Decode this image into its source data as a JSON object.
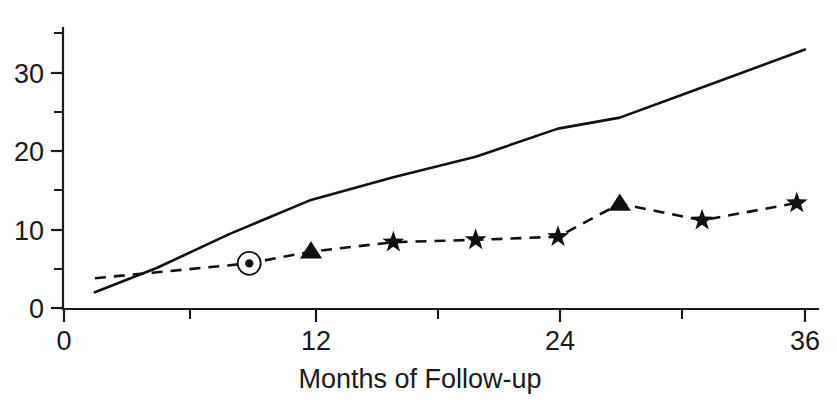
{
  "chart_data": {
    "type": "line",
    "title": "",
    "subtitle": "",
    "xlabel": "Months of Follow-up",
    "ylabel": "",
    "xlim": [
      0,
      36.8
    ],
    "ylim": [
      0,
      35
    ],
    "grid": false,
    "legend": "none",
    "x_ticks_major": [
      0,
      12,
      24,
      36
    ],
    "x_tick_labels": [
      "0",
      "12",
      "24",
      "36"
    ],
    "x_ticks_minor": [
      6,
      18,
      30
    ],
    "y_ticks_major": [
      0,
      10,
      20,
      30
    ],
    "y_tick_labels": [
      "0",
      "10",
      "20",
      "30"
    ],
    "y_ticks_minor": [
      5,
      15,
      25,
      35
    ],
    "series": [
      {
        "name": "solid-line",
        "style": "solid",
        "marker": "none",
        "color": "#111111",
        "x": [
          1.5,
          4.5,
          8,
          12,
          16,
          20,
          24,
          27,
          30,
          36
        ],
        "values": [
          2.0,
          5.1,
          9.4,
          13.8,
          16.7,
          19.3,
          22.9,
          24.3,
          27.2,
          33.0
        ]
      },
      {
        "name": "dashed-line",
        "style": "dashed",
        "marker": "mixed",
        "color": "#111111",
        "x": [
          1.5,
          9,
          12,
          16,
          20,
          24,
          27,
          31,
          35.6
        ],
        "values": [
          3.8,
          5.7,
          7.2,
          8.4,
          8.7,
          9.1,
          13.3,
          11.2,
          13.4
        ],
        "markers": [
          "none",
          "circled-dot",
          "triangle",
          "star",
          "star",
          "star",
          "triangle",
          "star",
          "star"
        ]
      }
    ],
    "annotations": [
      {
        "name": "circled-dot-marker",
        "x": 9,
        "y": 5.7,
        "shape": "circled-dot"
      }
    ]
  },
  "axis": {
    "x_title": "Months of Follow-up",
    "y_title": ""
  },
  "colors": {
    "ink": "#111111",
    "background": "#ffffff"
  }
}
